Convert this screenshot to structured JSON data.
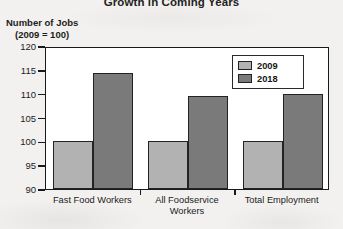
{
  "chart_data": {
    "type": "bar",
    "title": "Growth in Coming Years",
    "ylabel_line1": "Number of Jobs",
    "ylabel_line2": "(2009 = 100)",
    "xlabel": "",
    "categories": [
      "Fast Food Workers",
      "All Foodservice Workers",
      "Total Employment"
    ],
    "category_lines": [
      [
        "Fast Food Workers"
      ],
      [
        "All Foodservice",
        "Workers"
      ],
      [
        "Total Employment"
      ]
    ],
    "series": [
      {
        "name": "2009",
        "color": "#b2b2b2",
        "values": [
          100,
          100,
          100
        ]
      },
      {
        "name": "2018",
        "color": "#7a7a7a",
        "values": [
          114.3,
          109.6,
          110.0
        ]
      }
    ],
    "ylim": [
      90,
      120
    ],
    "yticks": [
      90,
      95,
      100,
      105,
      110,
      115,
      120
    ],
    "ytick_labels": [
      "90",
      "95",
      "100",
      "105",
      "110",
      "115",
      "120"
    ],
    "grid": false,
    "legend_position": "top-right",
    "legend_entries": [
      "2009",
      "2018"
    ]
  }
}
